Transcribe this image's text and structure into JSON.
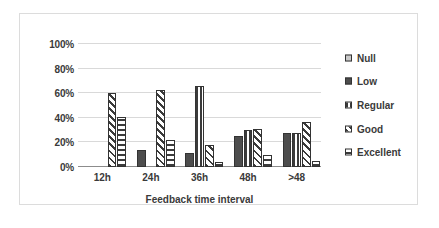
{
  "chart_data": {
    "type": "bar",
    "title": "",
    "subtitle": "",
    "xlabel": "Feedback time interval",
    "ylabel": "",
    "categories": [
      "12h",
      "24h",
      "36h",
      "48h",
      ">48"
    ],
    "ytick_labels": [
      "0%",
      "20%",
      "40%",
      "60%",
      "80%",
      "100%"
    ],
    "ytick_values": [
      0,
      20,
      40,
      60,
      80,
      100
    ],
    "ylim": [
      0,
      100
    ],
    "grid": true,
    "legend_position": "right",
    "series": [
      {
        "name": "Null",
        "pattern": "solid-light-gray",
        "color": "#c9c9c9",
        "values": [
          0,
          0,
          0,
          0,
          0
        ]
      },
      {
        "name": "Low",
        "pattern": "solid-dark-gray",
        "color": "#4d4d4d",
        "values": [
          0,
          14,
          11,
          25,
          28
        ]
      },
      {
        "name": "Regular",
        "pattern": "vertical-stripes",
        "color": "#3b3b3b",
        "values": [
          0,
          0,
          66,
          30,
          28
        ]
      },
      {
        "name": "Good",
        "pattern": "diagonal-stripes",
        "color": "#3b3b3b",
        "values": [
          60,
          63,
          18,
          31,
          37
        ]
      },
      {
        "name": "Excellent",
        "pattern": "horizontal-stripes",
        "color": "#3b3b3b",
        "values": [
          41,
          22,
          4,
          10,
          5
        ]
      }
    ]
  },
  "legend": {
    "items": [
      {
        "label": "Null"
      },
      {
        "label": "Low"
      },
      {
        "label": "Regular"
      },
      {
        "label": "Good"
      },
      {
        "label": "Excellent"
      }
    ]
  }
}
